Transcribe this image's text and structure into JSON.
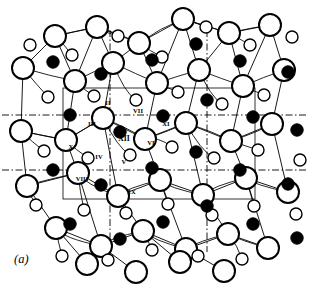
{
  "figure": {
    "caption": "(a)",
    "caption_x": 14,
    "caption_y": 252,
    "width": 310,
    "height": 284,
    "background_color": "#ffffff",
    "ink_color": "#000000"
  },
  "legend": {
    "large_open_circle": "large-open-circle-oxygen",
    "small_open_circle": "small-open-circle-oxygen",
    "filled_circle": "filled-circle-cation"
  },
  "unit_cell": {
    "style": "solid",
    "stroke_width": 0.8,
    "left": 63,
    "top": 88,
    "right": 255,
    "bottom": 199
  },
  "symmetry_lines": {
    "style": "dash-dot",
    "stroke_width": 0.9,
    "dash_pattern": "7,2.5,1.5,2.5",
    "horizontal_y": [
      115,
      170
    ],
    "horizontal_x_extent": [
      2,
      308
    ],
    "vertical_x": [
      110,
      207
    ],
    "vertical_y_extent": [
      30,
      252
    ]
  },
  "site_labels": [
    {
      "text": "II",
      "x": 108,
      "y": 103,
      "size": "small"
    },
    {
      "text": "III",
      "x": 92,
      "y": 124,
      "size": "small"
    },
    {
      "text": "VII",
      "x": 138,
      "y": 111,
      "size": "small"
    },
    {
      "text": "XI",
      "x": 166,
      "y": 124,
      "size": "small"
    },
    {
      "text": "XII",
      "x": 124,
      "y": 139,
      "size": "big"
    },
    {
      "text": "VI",
      "x": 151,
      "y": 143,
      "size": "small"
    },
    {
      "text": "X",
      "x": 71,
      "y": 147,
      "size": "small"
    },
    {
      "text": "IV",
      "x": 99,
      "y": 157,
      "size": "small"
    },
    {
      "text": "V",
      "x": 124,
      "y": 162,
      "size": "small"
    },
    {
      "text": "VIII",
      "x": 82,
      "y": 179,
      "size": "small"
    },
    {
      "text": "IX",
      "x": 132,
      "y": 192,
      "size": "small"
    }
  ],
  "chart_data": {
    "type": "scatter",
    "xlabel": "",
    "ylabel": "",
    "xlim": [
      0,
      310
    ],
    "ylim": [
      0,
      284
    ],
    "grid": false,
    "legend_position": "none",
    "series": [
      {
        "name": "filled-circle-cation",
        "marker": "filled-circle",
        "fill": "#000000",
        "stroke": "#000000",
        "radius": 6.2,
        "points": [
          [
            53,
            62
          ],
          [
            101,
            74
          ],
          [
            152,
            60
          ],
          [
            196,
            44
          ],
          [
            240,
            61
          ],
          [
            288,
            72
          ],
          [
            70,
            115
          ],
          [
            120,
            132
          ],
          [
            163,
            116
          ],
          [
            207,
            100
          ],
          [
            253,
            117
          ],
          [
            297,
            130
          ],
          [
            53,
            170
          ],
          [
            101,
            185
          ],
          [
            152,
            168
          ],
          [
            196,
            152
          ],
          [
            240,
            170
          ],
          [
            288,
            184
          ],
          [
            70,
            224
          ],
          [
            120,
            239
          ],
          [
            163,
            222
          ],
          [
            207,
            206
          ],
          [
            253,
            224
          ],
          [
            297,
            238
          ]
        ]
      },
      {
        "name": "large-open-circle-oxygen",
        "marker": "open-circle",
        "fill": "#ffffff",
        "stroke": "#000000",
        "radius": 11.0,
        "stroke_width": 2.0,
        "points": [
          [
            55,
            36
          ],
          [
            97,
            27
          ],
          [
            139,
            43
          ],
          [
            183,
            19
          ],
          [
            229,
            33
          ],
          [
            270,
            25
          ],
          [
            23,
            68
          ],
          [
            75,
            81
          ],
          [
            113,
            63
          ],
          [
            157,
            83
          ],
          [
            199,
            70
          ],
          [
            243,
            86
          ],
          [
            284,
            70
          ],
          [
            21,
            131
          ],
          [
            66,
            140
          ],
          [
            103,
            118
          ],
          [
            145,
            139
          ],
          [
            186,
            123
          ],
          [
            231,
            141
          ],
          [
            272,
            124
          ],
          [
            27,
            186
          ],
          [
            78,
            173
          ],
          [
            118,
            196
          ],
          [
            160,
            180
          ],
          [
            203,
            195
          ],
          [
            246,
            178
          ],
          [
            288,
            192
          ],
          [
            56,
            228
          ],
          [
            101,
            246
          ],
          [
            143,
            231
          ],
          [
            186,
            249
          ],
          [
            228,
            234
          ],
          [
            268,
            248
          ],
          [
            87,
            264
          ],
          [
            136,
            272
          ],
          [
            180,
            262
          ],
          [
            224,
            271
          ]
        ]
      },
      {
        "name": "small-open-circle-oxygen",
        "marker": "open-circle",
        "fill": "#ffffff",
        "stroke": "#000000",
        "radius": 6.0,
        "stroke_width": 1.4,
        "points": [
          [
            30,
            45
          ],
          [
            72,
            55
          ],
          [
            118,
            36
          ],
          [
            162,
            57
          ],
          [
            206,
            27
          ],
          [
            250,
            45
          ],
          [
            292,
            37
          ],
          [
            48,
            97
          ],
          [
            94,
            96
          ],
          [
            136,
            100
          ],
          [
            178,
            92
          ],
          [
            222,
            104
          ],
          [
            264,
            95
          ],
          [
            44,
            151
          ],
          [
            88,
            158
          ],
          [
            130,
            155
          ],
          [
            172,
            147
          ],
          [
            214,
            158
          ],
          [
            258,
            150
          ],
          [
            300,
            160
          ],
          [
            36,
            205
          ],
          [
            84,
            210
          ],
          [
            126,
            213
          ],
          [
            168,
            204
          ],
          [
            212,
            215
          ],
          [
            254,
            206
          ],
          [
            296,
            214
          ],
          [
            62,
            256
          ],
          [
            108,
            260
          ],
          [
            152,
            250
          ],
          [
            198,
            256
          ],
          [
            242,
            259
          ]
        ]
      }
    ]
  }
}
